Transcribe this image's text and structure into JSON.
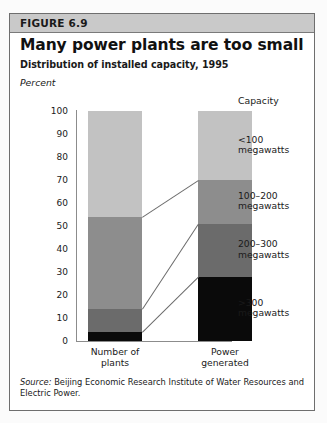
{
  "figure": {
    "number_label": "FIGURE 6.9",
    "title": "Many power plants are too small",
    "subtitle": "Distribution of installed capacity, 1995",
    "unit_label": "Percent",
    "legend_heading": "Capacity",
    "source_prefix": "Source:",
    "source_text": "Beijing Economic Research Institute of Water Resources and Electric Power."
  },
  "colors": {
    "band": "#c9c9c9",
    "border": "#6e6e6e",
    "axis": "#8c8c8c",
    "seg_lt100": "#c2c2c2",
    "seg_100_200": "#8d8d8d",
    "seg_200_300": "#6b6b6b",
    "seg_gt300": "#0a0a0a"
  },
  "chart_data": {
    "type": "bar",
    "title": "Many power plants are too small",
    "subtitle": "Distribution of installed capacity, 1995",
    "xlabel": "",
    "ylabel": "Percent",
    "ylim": [
      0,
      100
    ],
    "yticks": [
      0,
      10,
      20,
      30,
      40,
      50,
      60,
      70,
      80,
      90,
      100
    ],
    "ytick_labels": [
      "0",
      "10",
      "20",
      "30",
      "40",
      "50",
      "60",
      "70",
      "80",
      "90",
      "100"
    ],
    "grid": false,
    "stacked": true,
    "legend_position": "right",
    "legend_title": "Capacity",
    "categories": [
      "Number of plants",
      "Power generated"
    ],
    "category_labels": [
      [
        "Number of",
        "plants"
      ],
      [
        "Power",
        "generated"
      ]
    ],
    "series": [
      {
        "name": ">300 megawatts",
        "color": "#0a0a0a",
        "values": [
          4,
          28
        ]
      },
      {
        "name": "200-300 megawatts",
        "color": "#6b6b6b",
        "values": [
          10,
          23
        ]
      },
      {
        "name": "100-200 megawatts",
        "color": "#8d8d8d",
        "values": [
          40,
          19
        ]
      },
      {
        "name": "<100 megawatts",
        "color": "#c2c2c2",
        "values": [
          46,
          30
        ]
      }
    ],
    "cumulative_boundaries": {
      "Number of plants": [
        0,
        4,
        14,
        54,
        100
      ],
      "Power generated": [
        0,
        28,
        51,
        70,
        100
      ]
    },
    "annotations": [
      "Leader lines connect stacked segment boundaries between the two bars"
    ]
  },
  "legend": {
    "heading": "Capacity",
    "entries": [
      {
        "label_line1": "<100",
        "label_line2": "megawatts",
        "color": "#c2c2c2"
      },
      {
        "label_line1": "100–200",
        "label_line2": "megawatts",
        "color": "#8d8d8d"
      },
      {
        "label_line1": "200–300",
        "label_line2": "megawatts",
        "color": "#6b6b6b"
      },
      {
        "label_line1": ">300",
        "label_line2": "megawatts",
        "color": "#0a0a0a"
      }
    ]
  },
  "axis": {
    "ticks": [
      "100",
      "90",
      "80",
      "70",
      "60",
      "50",
      "40",
      "30",
      "20",
      "10",
      "0"
    ]
  },
  "xaxis": {
    "cat1_line1": "Number of",
    "cat1_line2": "plants",
    "cat2_line1": "Power",
    "cat2_line2": "generated"
  }
}
